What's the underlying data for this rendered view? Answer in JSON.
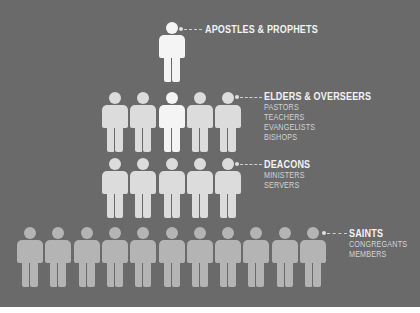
{
  "diagram": {
    "colors": {
      "background": "#6a6a6a",
      "figure_highlight": "#f4f4f4",
      "figure_upper": "#dcdcdc",
      "figure_lower": "#b4b4b4",
      "text": "#f2f2f2"
    },
    "tiers": [
      {
        "title": "APOSTLES & PROPHETS",
        "subtitles": [],
        "count": 1
      },
      {
        "title": "ELDERS & OVERSEERS",
        "subtitles": [
          "PASTORS",
          "TEACHERS",
          "EVANGELISTS",
          "BISHOPS"
        ],
        "count": 5
      },
      {
        "title": "DEACONS",
        "subtitles": [
          "MINISTERS",
          "SERVERS"
        ],
        "count": 5
      },
      {
        "title": "SAINTS",
        "subtitles": [
          "CONGREGANTS",
          "MEMBERS"
        ],
        "count": 11
      }
    ]
  }
}
